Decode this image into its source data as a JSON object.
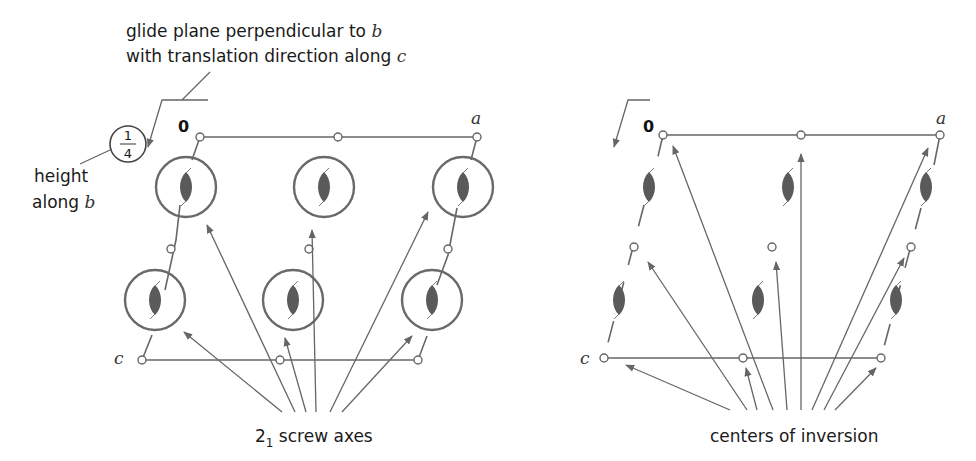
{
  "annotations": {
    "glide_line1": "glide plane perpendicular to ",
    "glide_line1_var": "b",
    "glide_line2": "with translation direction along ",
    "glide_line2_var": "c",
    "height_fraction_num": "1",
    "height_fraction_den": "4",
    "height_label_line1": "height",
    "height_label_line2": "along ",
    "height_label_var": "b"
  },
  "left_diagram": {
    "origin_label": "0",
    "a_label": "a",
    "c_label": "c",
    "caption_prefix": "2",
    "caption_sub": "1",
    "caption_rest": " screw axes"
  },
  "right_diagram": {
    "origin_label": "0",
    "a_label": "a",
    "c_label": "c",
    "caption": "centers of inversion"
  },
  "colors": {
    "line": "#666666",
    "lens": "#5a5a5a",
    "text": "#1a1a1a"
  }
}
